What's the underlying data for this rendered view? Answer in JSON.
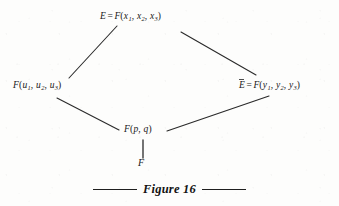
{
  "figure": {
    "caption_text": "Figure 16",
    "caption_rule_icon": "horizontal-rule",
    "background_color": "#fdfdfc",
    "ink_color": "#1a1a1a"
  },
  "diagram": {
    "type": "lattice-hasse-diagram",
    "nodes": {
      "top": {
        "id": "node-top",
        "field": "E",
        "overline": false,
        "operator": "=",
        "function": "F",
        "args": [
          "x",
          "x",
          "x"
        ],
        "subscripts": [
          "1",
          "2",
          "3"
        ],
        "separator": ",",
        "x": 145,
        "y": 18
      },
      "left": {
        "id": "node-left",
        "field": "",
        "overline": false,
        "operator": "",
        "function": "F",
        "args": [
          "u",
          "u",
          "u"
        ],
        "subscripts": [
          "1",
          "2",
          "3"
        ],
        "separator": ",",
        "x": 50,
        "y": 87
      },
      "right": {
        "id": "node-right",
        "field": "E",
        "overline": true,
        "operator": "=",
        "function": "F",
        "args": [
          "y",
          "y",
          "y"
        ],
        "subscripts": [
          "1",
          "2",
          "3"
        ],
        "separator": ",",
        "x": 286,
        "y": 87
      },
      "middle": {
        "id": "node-middle",
        "function": "F",
        "args": [
          "p",
          "q"
        ],
        "separator": ",",
        "x": 143,
        "y": 131
      },
      "bottom": {
        "id": "node-bottom",
        "field": "F",
        "x": 143,
        "y": 163
      }
    },
    "edges": [
      {
        "id": "edge-left-to-top",
        "from": "left",
        "to": "top",
        "x1": 69,
        "y1": 78,
        "x2": 117,
        "y2": 26
      },
      {
        "id": "edge-top-to-right",
        "from": "top",
        "to": "right",
        "x1": 181,
        "y1": 32,
        "x2": 256,
        "y2": 75
      },
      {
        "id": "edge-left-to-middle",
        "from": "left",
        "to": "middle",
        "x1": 57,
        "y1": 98,
        "x2": 119,
        "y2": 130
      },
      {
        "id": "edge-middle-to-right",
        "from": "middle",
        "to": "right",
        "x1": 167,
        "y1": 131,
        "x2": 269,
        "y2": 96
      },
      {
        "id": "edge-bottom-to-middle",
        "from": "bottom",
        "to": "middle",
        "x1": 143,
        "y1": 140,
        "x2": 143,
        "y2": 158
      }
    ]
  }
}
